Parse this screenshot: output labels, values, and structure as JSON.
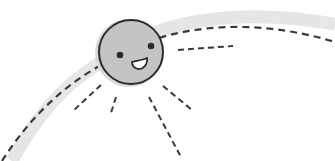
{
  "illustration": {
    "subject": "smiling sun on dashed orbit arc",
    "colors": {
      "background": "#ffffff",
      "sun_fill": "#c4c4c4",
      "sun_outline": "#2b2b2b",
      "orbit_band": "#e6e6e6",
      "dash_stroke": "#3a3a3a",
      "mouth_fill": "#ffffff"
    },
    "sun": {
      "cx": 130,
      "cy": 52,
      "r": 32
    },
    "rays_count": 5
  }
}
